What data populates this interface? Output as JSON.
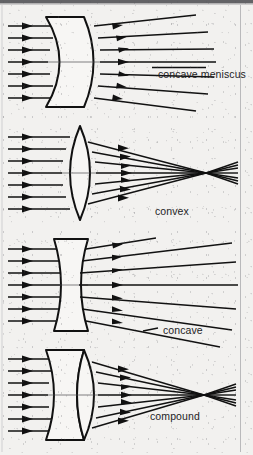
{
  "figure": {
    "title_visible": false,
    "background_color": "#f2f1ef",
    "ink_color": "#1a1a1a",
    "border": {
      "top_band": true,
      "right_rule": true
    },
    "panels": [
      {
        "id": "concave-meniscus",
        "label": "concave meniscus",
        "lens_type": "meniscus",
        "ray_behavior": "diverging",
        "label_x": 158,
        "label_y": 74,
        "leader_line": true
      },
      {
        "id": "convex",
        "label": "convex",
        "lens_type": "biconvex",
        "ray_behavior": "converging-to-focus",
        "label_x": 155,
        "label_y": 211,
        "leader_line": false
      },
      {
        "id": "concave",
        "label": "concave",
        "lens_type": "biconcave",
        "ray_behavior": "diverging",
        "label_x": 163,
        "label_y": 330,
        "leader_line": true
      },
      {
        "id": "compound",
        "label": "compound",
        "lens_type": "compound-doublet",
        "ray_behavior": "converging-to-focus",
        "label_x": 150,
        "label_y": 416,
        "leader_line": false
      }
    ],
    "ray_count_per_panel": 7,
    "arrowhead_style": "solid-triangle"
  }
}
